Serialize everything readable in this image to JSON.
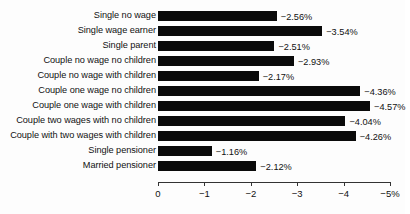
{
  "chart_data": {
    "type": "bar",
    "orientation": "horizontal",
    "title": "",
    "subtitle": "",
    "xlabel": "",
    "ylabel": "",
    "xlim": [
      0,
      -5
    ],
    "grid": false,
    "legend": null,
    "value_suffix": "%",
    "categories": [
      "Single no wage",
      "Single wage earner",
      "Single parent",
      "Couple no wage no children",
      "Couple no wage with children",
      "Couple one wage no children",
      "Couple one wage with children",
      "Couple two wages with no children",
      "Couple with two wages with children",
      "Single pensioner",
      "Married pensioner"
    ],
    "values": [
      -2.56,
      -3.54,
      -2.51,
      -2.93,
      -2.17,
      -4.36,
      -4.57,
      -4.04,
      -4.26,
      -1.16,
      -2.12
    ],
    "data_labels": [
      "−2.56%",
      "−3.54%",
      "−2.51%",
      "−2.93%",
      "−2.17%",
      "−4.36%",
      "−4.57%",
      "−4.04%",
      "−4.26%",
      "−1.16%",
      "−2.12%"
    ],
    "xticks": [
      0,
      -1,
      -2,
      -3,
      -4,
      -5
    ],
    "xtick_labels": [
      "0",
      "−1",
      "−2",
      "−3",
      "−4",
      "−5%"
    ],
    "colors": {
      "bar": "#0a0a0a",
      "axis": "#333333",
      "text": "#111111",
      "background": "#fdfdfd"
    }
  }
}
